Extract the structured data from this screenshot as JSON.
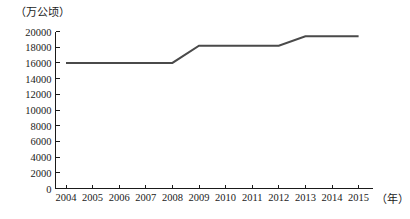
{
  "chart_data": {
    "type": "line",
    "title": "",
    "xlabel": "（年）",
    "ylabel": "（万公顷）",
    "categories": [
      "2004",
      "2005",
      "2006",
      "2007",
      "2008",
      "2009",
      "2010",
      "2011",
      "2012",
      "2013",
      "2014",
      "2015"
    ],
    "values": [
      16000,
      16000,
      16000,
      16000,
      16000,
      18200,
      18200,
      18200,
      18200,
      19400,
      19400,
      19400
    ],
    "ylim": [
      0,
      20000
    ],
    "yticks": [
      0,
      2000,
      4000,
      6000,
      8000,
      10000,
      12000,
      14000,
      16000,
      18000,
      20000
    ],
    "ytick_labels": [
      "0",
      "2000",
      "4000",
      "6000",
      "8000",
      "10000",
      "12000",
      "14000",
      "16000",
      "18000",
      "20000"
    ],
    "grid": false,
    "legend": null,
    "line_color": "#4a4a4a",
    "axis_color": "#1a1a1a"
  }
}
